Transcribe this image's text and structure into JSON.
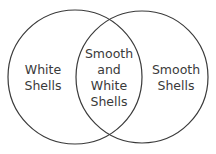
{
  "diagram": {
    "type": "venn",
    "sets": [
      {
        "label_line1": "White",
        "label_line2": "Shells"
      },
      {
        "label_line1": "Smooth",
        "label_line2": "Shells"
      }
    ],
    "intersection": {
      "line1": "Smooth",
      "line2": "and",
      "line3": "White",
      "line4": "Shells"
    },
    "stroke_color": "#3a3a3a"
  }
}
